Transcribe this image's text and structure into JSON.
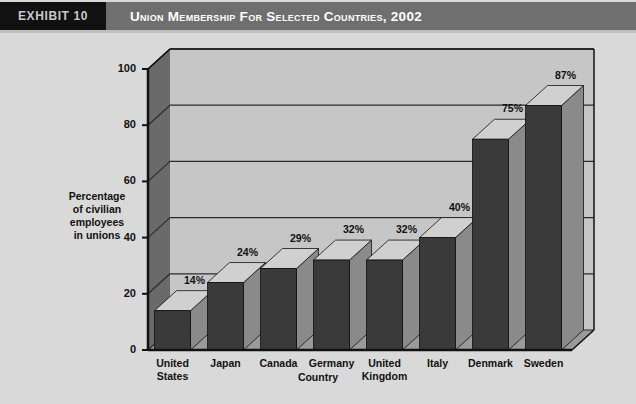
{
  "header": {
    "exhibit_tag": "EXHIBIT 10",
    "title": "Union Membership for Selected Countries, 2002",
    "tag_bg": "#111111",
    "band_bg": "#6f6f6f",
    "title_color": "#ffffff"
  },
  "chart_data": {
    "type": "bar",
    "title": "Union Membership for Selected Countries, 2002",
    "xlabel": "Country",
    "ylabel": "Percentage of civilian employees in unions",
    "ylabel_lines": [
      "Percentage",
      "of civilian",
      "employees",
      "in unions"
    ],
    "categories": [
      "United States",
      "Japan",
      "Canada",
      "Germany",
      "United Kingdom",
      "Italy",
      "Denmark",
      "Sweden"
    ],
    "category_lines": [
      [
        "United",
        "States"
      ],
      [
        "Japan"
      ],
      [
        "Canada"
      ],
      [
        "Germany"
      ],
      [
        "United",
        "Kingdom"
      ],
      [
        "Italy"
      ],
      [
        "Denmark"
      ],
      [
        "Sweden"
      ]
    ],
    "values": [
      14,
      24,
      29,
      32,
      32,
      40,
      75,
      87
    ],
    "data_labels": [
      "14%",
      "24%",
      "29%",
      "32%",
      "32%",
      "40%",
      "75%",
      "87%"
    ],
    "ylim": [
      0,
      100
    ],
    "yticks": [
      0,
      20,
      40,
      60,
      80,
      100
    ],
    "ytick_labels": [
      "0",
      "20",
      "40",
      "60",
      "80",
      "100"
    ],
    "grid": true,
    "legend": "none",
    "style": "3d-column",
    "colors": {
      "bar_front": "#3a3a3a",
      "bar_top": "#d0d0d0",
      "bar_side": "#8a8a8a",
      "plot_bg": "#c6c6c6",
      "wall_side": "#6a6a6a",
      "floor": "#9a9a9a",
      "gridline": "#2b2b2b",
      "page_bg": "#d9d9d9",
      "axis": "#111111"
    }
  }
}
